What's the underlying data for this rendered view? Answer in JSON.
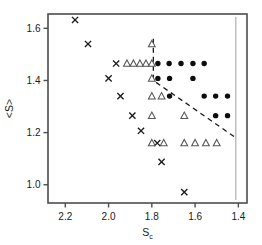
{
  "chart_data": {
    "type": "scatter",
    "title": "",
    "xlabel": "S_c",
    "xlabel_base": "S",
    "xlabel_sub": "c",
    "ylabel": "<S>",
    "xlim": [
      2.28,
      1.36
    ],
    "ylim": [
      0.93,
      1.655
    ],
    "x_reversed": true,
    "grid": false,
    "legend": "none",
    "xticks": [
      "2.2",
      "2.0",
      "1.8",
      "1.6",
      "1.4"
    ],
    "xtick_values": [
      2.2,
      2.0,
      1.8,
      1.6,
      1.4
    ],
    "yticks": [
      "1.6",
      "1.4",
      "1.2",
      "1.0"
    ],
    "ytick_values": [
      1.6,
      1.4,
      1.2,
      1.0
    ],
    "series": [
      {
        "name": "cross",
        "marker": "x",
        "color": "#1a1a1a",
        "points": [
          [
            2.155,
            1.632
          ],
          [
            2.095,
            1.54
          ],
          [
            1.965,
            1.465
          ],
          [
            2.0,
            1.408
          ],
          [
            1.945,
            1.34
          ],
          [
            1.89,
            1.265
          ],
          [
            1.85,
            1.207
          ],
          [
            1.775,
            1.16
          ],
          [
            1.755,
            1.088
          ],
          [
            1.65,
            0.972
          ]
        ]
      },
      {
        "name": "open-triangle",
        "marker": "triangle-up-open",
        "color": "#555555",
        "points": [
          [
            1.8,
            1.54
          ],
          [
            1.915,
            1.465
          ],
          [
            1.885,
            1.465
          ],
          [
            1.855,
            1.465
          ],
          [
            1.827,
            1.465
          ],
          [
            1.8,
            1.465
          ],
          [
            1.8,
            1.408
          ],
          [
            1.8,
            1.34
          ],
          [
            1.755,
            1.34
          ],
          [
            1.8,
            1.265
          ],
          [
            1.8,
            1.16
          ],
          [
            1.745,
            1.16
          ],
          [
            1.65,
            1.265
          ],
          [
            1.65,
            1.16
          ],
          [
            1.6,
            1.16
          ],
          [
            1.55,
            1.16
          ],
          [
            1.5,
            1.16
          ]
        ]
      },
      {
        "name": "filled-circle",
        "marker": "circle-filled",
        "color": "#0d0d0d",
        "points": [
          [
            1.772,
            1.465
          ],
          [
            1.72,
            1.465
          ],
          [
            1.665,
            1.465
          ],
          [
            1.61,
            1.465
          ],
          [
            1.558,
            1.465
          ],
          [
            1.772,
            1.408
          ],
          [
            1.718,
            1.408
          ],
          [
            1.61,
            1.408
          ],
          [
            1.718,
            1.34
          ],
          [
            1.558,
            1.34
          ],
          [
            1.505,
            1.34
          ],
          [
            1.45,
            1.34
          ],
          [
            1.505,
            1.265
          ],
          [
            1.45,
            1.265
          ]
        ]
      }
    ],
    "annotations": [
      {
        "name": "phase-boundary-dashed",
        "kind": "dashed-path",
        "points": [
          [
            1.793,
            1.56
          ],
          [
            1.793,
            1.4
          ],
          [
            1.408,
            1.178
          ]
        ]
      },
      {
        "name": "asymptote-line",
        "kind": "vertical-line",
        "x": 1.412,
        "color": "#bbbbbb"
      }
    ]
  }
}
